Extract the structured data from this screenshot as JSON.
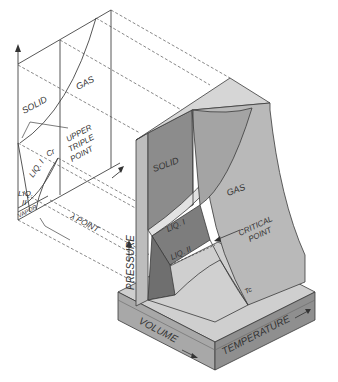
{
  "diagram": {
    "pt_projection": {
      "labels": {
        "solid": "SOLID",
        "gas": "GAS",
        "upper_triple_point": [
          "UPPER",
          "TRIPLE",
          "POINT"
        ],
        "critical": "Cr",
        "liquid_one": "LIQ. I",
        "liquid_two": [
          "LIQ.",
          "II"
        ],
        "vapor": "VAPOR",
        "lambda_point": "λ POINT"
      }
    },
    "surface": {
      "labels": {
        "solid": "SOLID",
        "gas": "GAS",
        "liquid_one": "LIQ. I",
        "liquid_two": "LIQ. II",
        "critical_point": [
          "CRITICAL",
          "POINT"
        ],
        "critical_temperature": "Tc"
      }
    },
    "axes": {
      "pressure": "PRESSURE",
      "volume": "VOLUME",
      "temperature": "TEMPERATURE"
    },
    "colors": {
      "line": "#3a3a3a",
      "solid_face": "#8c8c8c",
      "gas_face": "#b9b9b9",
      "liquid_face": "#7d7d7d",
      "top_face": "#d6d6d6",
      "base_front": "#a8a8a8",
      "base_right": "#8f8f8f",
      "base_top": "#cfcfcf"
    }
  }
}
